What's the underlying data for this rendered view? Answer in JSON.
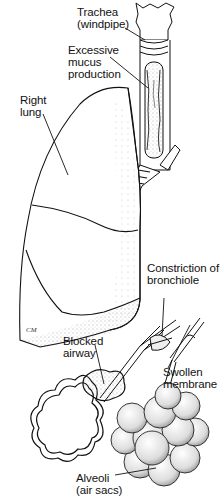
{
  "figure": {
    "labels": {
      "trachea": "Trachea\n(windpipe)",
      "mucus": "Excessive\nmucus\nproduction",
      "right_lung": "Right\nlung",
      "constriction": "Constriction of\nbronchiole",
      "blocked_airway": "Blocked\nairway",
      "swollen_membrane": "Swollen\nmembrane",
      "alveoli": "Alveoli\n(air sacs)"
    },
    "signature": "CM"
  }
}
